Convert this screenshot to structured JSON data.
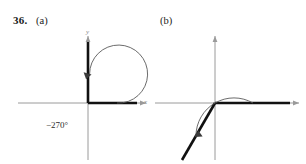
{
  "problem": {
    "number": "36.",
    "parts": [
      {
        "key": "a",
        "label": "(a)"
      },
      {
        "key": "b",
        "label": "(b)"
      }
    ]
  },
  "figures": [
    {
      "id": "figure-a",
      "part": "(a)",
      "angle_label": "−270°",
      "angle_degrees": -270,
      "direction": "clockwise",
      "initial_ray": "positive-x-axis",
      "terminal_ray": "positive-y-axis",
      "axis_labels": {
        "x": "x",
        "y": "y"
      },
      "origin": {
        "x": 88,
        "y": 103
      }
    },
    {
      "id": "figure-b",
      "part": "(b)",
      "angle_label": "−120°",
      "angle_degrees": -120,
      "direction": "clockwise",
      "initial_ray": "positive-x-axis",
      "terminal_ray": "third-quadrant-ray",
      "axis_labels": {
        "x": "x",
        "y": "y"
      },
      "origin": {
        "x": 62,
        "y": 103
      }
    }
  ],
  "colors": {
    "ink": "#1a1a1a",
    "axis": "#9a9a9a",
    "ray": "#111111",
    "arc": "#5a5a5a",
    "label": "#8a8a8a"
  }
}
